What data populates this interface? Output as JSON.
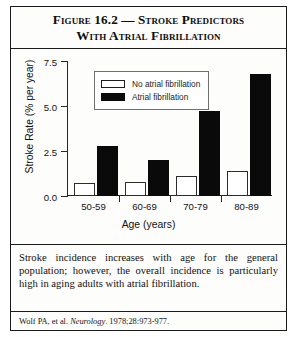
{
  "figure": {
    "title_line1": "Figure 16.2 — Stroke Predictors",
    "title_line2": "With Atrial Fibrillation",
    "caption": "Stroke incidence increases with age for the general population; however, the overall incidence is particularly high in aging adults with atrial fibrillation.",
    "citation_prefix": "Wolf PA, et al. ",
    "citation_journal": "Neurology",
    "citation_suffix": ". 1978;28:973-977."
  },
  "chart_data": {
    "type": "bar",
    "title": "Figure 16.2 — Stroke Predictors With Atrial Fibrillation",
    "xlabel": "Age (years)",
    "ylabel": "Stroke Rate (% per year)",
    "categories": [
      "50-59",
      "60-69",
      "70-79",
      "80-89"
    ],
    "yticks": [
      "0.0",
      "2.5",
      "5.0",
      "7.5"
    ],
    "ytick_values": [
      0.0,
      2.5,
      5.0,
      7.5
    ],
    "ylim": [
      0,
      7.5
    ],
    "grid": false,
    "legend_position": "upper-left-inside",
    "series": [
      {
        "name": "No atrial fibrillation",
        "color": "#ffffff",
        "edge": "#2b2b2b",
        "values": [
          0.7,
          0.8,
          1.1,
          1.4
        ]
      },
      {
        "name": "Atrial fibrillation",
        "color": "#0a0a0a",
        "edge": "#0a0a0a",
        "values": [
          2.8,
          2.0,
          4.7,
          6.8
        ]
      }
    ]
  }
}
